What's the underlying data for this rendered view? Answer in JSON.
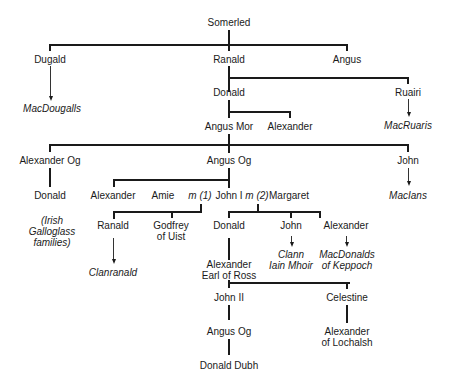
{
  "diagram": {
    "type": "family-tree",
    "root": "Somerled",
    "nodes": {
      "somerled": "Somerled",
      "dugald": "Dugald",
      "ranald": "Ranald",
      "angus": "Angus",
      "macdougalls": "MacDougalls",
      "donald_1": "Donald",
      "ruairi": "Ruairi",
      "macruaris": "MacRuaris",
      "angus_mor": "Angus Mor",
      "alexander_1": "Alexander",
      "alexander_og": "Alexander Og",
      "angus_og_1": "Angus Og",
      "john_1": "John",
      "macians": "MacIans",
      "donald_2": "Donald",
      "irish_line1": "(Irish",
      "irish_line2": "Galloglass",
      "irish_line3": "families)",
      "alexander_2": "Alexander",
      "amie": "Amie",
      "m1": "m (1)",
      "john_i": "John I",
      "m2": "m (2)",
      "margaret": "Margaret",
      "ranald_2": "Ranald",
      "godfrey_line1": "Godfrey",
      "godfrey_line2": "of Uist",
      "donald_3": "Donald",
      "john_2": "John",
      "alexander_3": "Alexander",
      "clanranald": "Clanranald",
      "clann_line1": "Clann",
      "clann_line2": "Iain Mhoir",
      "keppoch_line1": "MacDonalds",
      "keppoch_line2": "of Keppoch",
      "earl_line1": "Alexander",
      "earl_line2": "Earl of Ross",
      "john_ii": "John II",
      "celestine": "Celestine",
      "angus_og_2": "Angus Og",
      "lochalsh_line1": "Alexander",
      "lochalsh_line2": "of Lochalsh",
      "donald_dubh": "Donald Dubh"
    },
    "edges": [
      [
        "Somerled",
        "Dugald"
      ],
      [
        "Somerled",
        "Ranald"
      ],
      [
        "Somerled",
        "Angus"
      ],
      [
        "Dugald",
        "MacDougalls",
        "descent-arrow"
      ],
      [
        "Ranald",
        "Donald"
      ],
      [
        "Ranald",
        "Ruairi"
      ],
      [
        "Ruairi",
        "MacRuaris",
        "descent-arrow"
      ],
      [
        "Donald",
        "Angus Mor"
      ],
      [
        "Donald",
        "Alexander"
      ],
      [
        "Angus Mor",
        "Alexander Og"
      ],
      [
        "Angus Mor",
        "Angus Og"
      ],
      [
        "Angus Mor",
        "John"
      ],
      [
        "John",
        "MacIans",
        "descent-arrow"
      ],
      [
        "Alexander Og",
        "Donald"
      ],
      [
        "Angus Og",
        "Alexander"
      ],
      [
        "Angus Og",
        "John I"
      ],
      [
        "John I + Amie",
        "Ranald"
      ],
      [
        "John I + Amie",
        "Godfrey of Uist"
      ],
      [
        "Ranald",
        "Clanranald",
        "descent-arrow"
      ],
      [
        "John I + Margaret",
        "Donald"
      ],
      [
        "John I + Margaret",
        "John"
      ],
      [
        "John I + Margaret",
        "Alexander"
      ],
      [
        "John",
        "Clann Iain Mhoir",
        "descent-arrow"
      ],
      [
        "Alexander",
        "MacDonalds of Keppoch",
        "descent-arrow"
      ],
      [
        "Donald",
        "Alexander Earl of Ross"
      ],
      [
        "Alexander Earl of Ross",
        "John II"
      ],
      [
        "Alexander Earl of Ross",
        "Celestine"
      ],
      [
        "John II",
        "Angus Og"
      ],
      [
        "Celestine",
        "Alexander of Lochalsh"
      ],
      [
        "Angus Og",
        "Donald Dubh"
      ]
    ]
  }
}
